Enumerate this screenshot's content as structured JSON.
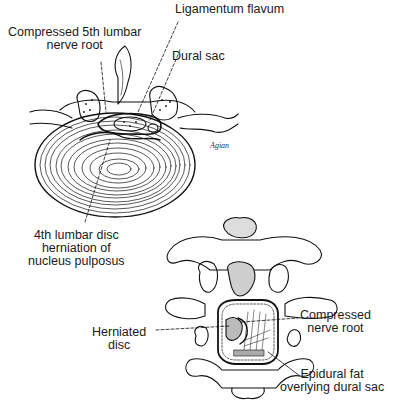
{
  "figure": {
    "top_view": {
      "labels": [
        {
          "id": "ligamentum-flavum",
          "lines": [
            "Ligamentum flavum"
          ]
        },
        {
          "id": "compressed-5th-lumbar-nerve-root",
          "lines": [
            "Compressed 5th lumbar",
            "nerve root"
          ]
        },
        {
          "id": "dural-sac",
          "lines": [
            "Dural sac"
          ]
        },
        {
          "id": "4th-lumbar-disc-herniation",
          "lines": [
            "4th lumbar disc",
            "herniation of",
            "nucleus pulposus"
          ]
        }
      ],
      "signature": "Agian"
    },
    "posterior_view": {
      "labels": [
        {
          "id": "herniated-disc",
          "lines": [
            "Herniated",
            "disc"
          ]
        },
        {
          "id": "compressed-nerve-root",
          "lines": [
            "Compressed",
            "nerve root"
          ]
        },
        {
          "id": "epidural-fat",
          "lines": [
            "Epidural fat",
            "overlying dural sac"
          ]
        }
      ]
    }
  }
}
